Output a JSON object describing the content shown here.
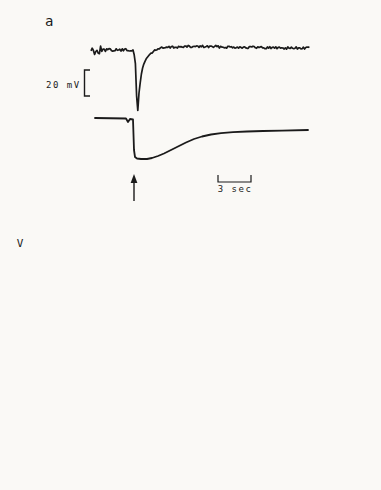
{
  "colors": {
    "ink": "#1b1b1b",
    "paper": "#faf9f6"
  },
  "panel_a": {
    "label": "a",
    "voltage_scale": {
      "label": "20 mV",
      "bracket_px": {
        "x": 84.5,
        "y0": 70,
        "y1": 96,
        "cap": 5.5
      }
    },
    "time_scale": {
      "label": "3 sec",
      "bracket_px": {
        "x0": 218,
        "x1": 251,
        "y": 182,
        "cap": 7
      }
    },
    "stimulus_arrow_px": {
      "x": 134,
      "y_tail": 201,
      "y_tip": 174
    },
    "traces": {
      "top": {
        "points": [
          [
            91,
            50
          ],
          [
            133,
            50
          ],
          [
            135,
            58
          ],
          [
            136,
            72
          ],
          [
            137,
            112
          ],
          [
            138,
            110
          ],
          [
            139,
            93
          ],
          [
            141,
            76
          ],
          [
            143,
            66
          ],
          [
            146,
            59
          ],
          [
            150,
            54
          ],
          [
            155,
            50
          ],
          [
            162,
            48
          ],
          [
            175,
            47
          ],
          [
            200,
            46.5
          ],
          [
            230,
            47
          ],
          [
            260,
            47.5
          ],
          [
            290,
            48
          ],
          [
            310,
            48
          ]
        ],
        "noise": [
          {
            "x0": 91,
            "x1": 101,
            "amp": 4.5
          },
          {
            "x0": 101,
            "x1": 133,
            "amp": 1.4
          },
          {
            "x0": 152,
            "x1": 310,
            "amp": 1.3
          }
        ],
        "width": 1.7
      },
      "middle": {
        "points": [
          [
            95,
            118
          ],
          [
            126,
            118.5
          ],
          [
            128,
            122
          ],
          [
            130,
            119
          ],
          [
            133,
            119.5
          ],
          [
            134,
            150
          ],
          [
            135,
            157
          ],
          [
            137,
            158.5
          ],
          [
            141,
            159
          ],
          [
            147,
            159
          ],
          [
            152,
            158
          ],
          [
            158,
            156
          ],
          [
            164,
            153.5
          ],
          [
            171,
            150
          ],
          [
            178,
            146.5
          ],
          [
            186,
            142.5
          ],
          [
            194,
            139
          ],
          [
            202,
            136.5
          ],
          [
            211,
            134.5
          ],
          [
            221,
            133.2
          ],
          [
            233,
            132.2
          ],
          [
            247,
            131.5
          ],
          [
            263,
            131
          ],
          [
            282,
            130.6
          ],
          [
            308,
            130
          ]
        ],
        "width": 1.8
      },
      "middle_spikes": [
        [
          89,
          113,
          150
        ],
        [
          91,
          110,
          155
        ],
        [
          93,
          112,
          146
        ],
        [
          95,
          111,
          152
        ],
        [
          97,
          114,
          142
        ],
        [
          99,
          115,
          150
        ],
        [
          101,
          116,
          136
        ],
        [
          104,
          117,
          127
        ],
        [
          228,
          127.5,
          133.5
        ],
        [
          268,
          126.5,
          132.5
        ]
      ],
      "bottom": {
        "points": [
          [
            88,
            166
          ],
          [
            310,
            171
          ]
        ],
        "width": 1.3,
        "tick_xs": [
          100,
          136,
          141,
          187,
          228,
          268
        ],
        "tick_len": 4.5
      }
    }
  },
  "chart_data": [
    {
      "id": "b",
      "type": "line",
      "panel_label": "b",
      "ylabel": "V",
      "xlabel": "t secs",
      "xlim": [
        0,
        23.2
      ],
      "ylim": [
        -0.97,
        0.8
      ],
      "x_ticks": [
        0,
        10,
        20
      ],
      "x_minor_step": 2,
      "y_ticks": [
        0.4,
        0.0,
        -0.4,
        -0.8
      ],
      "y_minor_step": 0.2,
      "show_y_labels": true,
      "annotation": {
        "value": "647.1",
        "unit": "nm"
      },
      "series": [
        {
          "name": "C",
          "style": "solid",
          "label": {
            "text": "C",
            "t": 16.2,
            "v": 0.25
          },
          "points": [
            [
              0.4,
              0.095
            ],
            [
              1,
              0.12
            ],
            [
              2,
              0.155
            ],
            [
              3,
              0.175
            ],
            [
              4,
              0.19
            ],
            [
              5,
              0.198
            ],
            [
              6,
              0.203
            ],
            [
              7,
              0.207
            ],
            [
              8,
              0.209
            ],
            [
              10,
              0.21
            ],
            [
              12,
              0.21
            ],
            [
              14,
              0.21
            ],
            [
              16,
              0.21
            ],
            [
              18,
              0.21
            ],
            [
              20,
              0.21
            ],
            [
              22,
              0.21
            ],
            [
              23.2,
              0.21
            ]
          ]
        },
        {
          "name": "C-cal",
          "style": "dashed",
          "label": {
            "text": "C",
            "sub": "cal",
            "t": 19.8,
            "v": 0.135
          },
          "points": [
            [
              1.4,
              0.27
            ],
            [
              2,
              0.285
            ],
            [
              2.8,
              0.29
            ],
            [
              3.6,
              0.285
            ],
            [
              4.5,
              0.272
            ],
            [
              5.5,
              0.255
            ],
            [
              6.5,
              0.235
            ],
            [
              7.5,
              0.215
            ],
            [
              8.5,
              0.2
            ],
            [
              9.5,
              0.185
            ],
            [
              11,
              0.165
            ],
            [
              12.5,
              0.15
            ],
            [
              14,
              0.135
            ],
            [
              15.5,
              0.12
            ],
            [
              17,
              0.11
            ],
            [
              18.5,
              0.1
            ],
            [
              20,
              0.09
            ],
            [
              21.5,
              0.082
            ],
            [
              23.2,
              0.075
            ]
          ]
        },
        {
          "name": "DRP",
          "style": "solid",
          "label": {
            "text": "DRP",
            "px": [
              48,
              316
            ],
            "cls": "drp",
            "anchor": "start"
          },
          "points": [
            [
              0.3,
              0.005
            ],
            [
              3.3,
              0.005
            ]
          ]
        },
        {
          "name": "zero-marker",
          "style": "solid",
          "points": [
            [
              20.7,
              -0.002
            ],
            [
              23.2,
              -0.002
            ]
          ]
        },
        {
          "name": "L",
          "style": "solid",
          "label": {
            "text": "L",
            "t": 8.6,
            "v": -0.49
          },
          "points": [
            [
              1.7,
              -0.96
            ],
            [
              2.5,
              -0.92
            ],
            [
              3.5,
              -0.86
            ],
            [
              4.5,
              -0.8
            ],
            [
              5.5,
              -0.73
            ],
            [
              6.5,
              -0.655
            ],
            [
              7.5,
              -0.585
            ],
            [
              8.5,
              -0.52
            ],
            [
              9.5,
              -0.465
            ],
            [
              10.5,
              -0.42
            ],
            [
              11.5,
              -0.38
            ],
            [
              12.5,
              -0.345
            ],
            [
              13.5,
              -0.315
            ],
            [
              14.5,
              -0.29
            ],
            [
              15.5,
              -0.27
            ],
            [
              16.5,
              -0.253
            ],
            [
              17.5,
              -0.24
            ],
            [
              18.5,
              -0.228
            ],
            [
              19.5,
              -0.218
            ],
            [
              20.5,
              -0.209
            ],
            [
              21.5,
              -0.202
            ],
            [
              22.5,
              -0.195
            ],
            [
              23.2,
              -0.19
            ]
          ]
        }
      ]
    },
    {
      "id": "c",
      "type": "line",
      "panel_label": "c",
      "ylabel": "",
      "xlabel": "t secs",
      "xlim": [
        0,
        23.8
      ],
      "ylim": [
        -0.97,
        0.8
      ],
      "x_ticks": [
        0,
        10,
        20
      ],
      "x_minor_step": 2,
      "y_ticks": [
        0.4,
        0.0,
        -0.4,
        -0.8
      ],
      "y_minor_step": 0.2,
      "show_y_labels": false,
      "annotation": {
        "value": "647.1",
        "unit": "nm"
      },
      "series": [
        {
          "name": "C-cal",
          "style": "dashed",
          "label": {
            "text": "C",
            "sub": "cal",
            "t": 4.2,
            "v": 0.45
          },
          "points": [
            [
              1.2,
              0.5
            ],
            [
              2,
              0.455
            ],
            [
              2.8,
              0.41
            ],
            [
              3.6,
              0.36
            ],
            [
              4.4,
              0.31
            ],
            [
              5.2,
              0.262
            ],
            [
              6,
              0.218
            ],
            [
              6.8,
              0.178
            ],
            [
              7.6,
              0.143
            ],
            [
              8.4,
              0.112
            ],
            [
              9.2,
              0.086
            ],
            [
              10,
              0.065
            ],
            [
              10.8,
              0.051
            ],
            [
              11.6,
              0.042
            ],
            [
              12.4,
              0.038
            ],
            [
              13.5,
              0.036
            ],
            [
              15,
              0.036
            ],
            [
              17,
              0.037
            ],
            [
              19,
              0.038
            ],
            [
              21,
              0.04
            ],
            [
              23.8,
              0.042
            ]
          ]
        },
        {
          "name": "C",
          "style": "solid",
          "label": {
            "text": "C",
            "t": 9.6,
            "v": 0.43
          },
          "points": [
            [
              2.2,
              0.09
            ],
            [
              3,
              0.135
            ],
            [
              4,
              0.18
            ],
            [
              5,
              0.22
            ],
            [
              6,
              0.258
            ],
            [
              7,
              0.292
            ],
            [
              8,
              0.32
            ],
            [
              9,
              0.343
            ],
            [
              10,
              0.362
            ],
            [
              11,
              0.376
            ],
            [
              12,
              0.385
            ],
            [
              13,
              0.39
            ],
            [
              14,
              0.393
            ],
            [
              15,
              0.396
            ],
            [
              16,
              0.398
            ],
            [
              17,
              0.4
            ],
            [
              18,
              0.401
            ],
            [
              19,
              0.4
            ],
            [
              20,
              0.394
            ],
            [
              21,
              0.382
            ],
            [
              22,
              0.362
            ],
            [
              23,
              0.336
            ],
            [
              23.8,
              0.312
            ]
          ]
        },
        {
          "name": "DRP",
          "style": "solid",
          "label": {
            "text": "DRP",
            "px": [
              214,
              315
            ],
            "cls": "drp",
            "anchor": "start"
          },
          "points": [
            [
              0.05,
              0.004
            ],
            [
              2.4,
              0.004
            ]
          ]
        },
        {
          "name": "zero-marker",
          "style": "solid",
          "points": [
            [
              21.2,
              0.0
            ],
            [
              23.6,
              0.0
            ]
          ]
        },
        {
          "name": "L",
          "style": "solid",
          "label": {
            "text": "L",
            "t": 4.3,
            "v": -0.49
          },
          "points": [
            [
              2.9,
              -0.96
            ],
            [
              3.4,
              -0.9
            ],
            [
              3.9,
              -0.835
            ],
            [
              4.4,
              -0.77
            ],
            [
              4.9,
              -0.7
            ],
            [
              5.4,
              -0.635
            ],
            [
              5.9,
              -0.565
            ],
            [
              6.4,
              -0.5
            ],
            [
              6.9,
              -0.44
            ],
            [
              7.4,
              -0.385
            ],
            [
              7.9,
              -0.335
            ],
            [
              8.4,
              -0.29
            ],
            [
              8.9,
              -0.25
            ],
            [
              9.4,
              -0.215
            ],
            [
              9.9,
              -0.185
            ],
            [
              10.4,
              -0.16
            ],
            [
              10.9,
              -0.14
            ],
            [
              11.4,
              -0.122
            ],
            [
              11.9,
              -0.108
            ],
            [
              12.6,
              -0.094
            ],
            [
              13.4,
              -0.083
            ],
            [
              14.2,
              -0.075
            ],
            [
              15,
              -0.068
            ],
            [
              16,
              -0.061
            ],
            [
              17,
              -0.056
            ],
            [
              18,
              -0.051
            ],
            [
              19,
              -0.047
            ],
            [
              20,
              -0.044
            ],
            [
              21,
              -0.041
            ],
            [
              22,
              -0.038
            ],
            [
              23,
              -0.035
            ],
            [
              23.8,
              -0.033
            ]
          ]
        }
      ]
    }
  ]
}
